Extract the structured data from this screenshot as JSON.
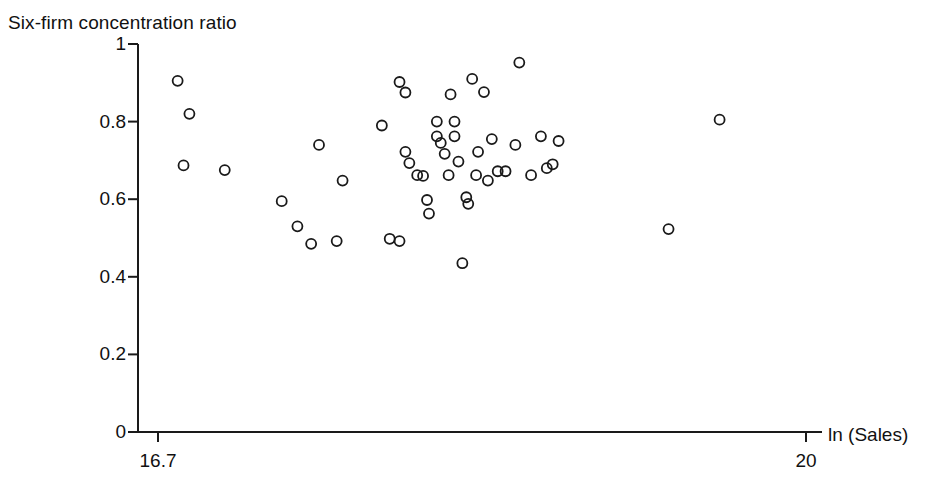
{
  "chart_data": {
    "type": "scatter",
    "title": "",
    "ylabel": "Six-firm concentration ratio",
    "xlabel": "ln (Sales)",
    "xlim": [
      16.7,
      20.0
    ],
    "ylim": [
      0,
      1
    ],
    "grid": false,
    "legend": null,
    "x_ticks": [
      {
        "value": 16.7,
        "label": "16.7"
      },
      {
        "value": 20,
        "label": "20"
      }
    ],
    "y_ticks": [
      {
        "value": 0,
        "label": "0"
      },
      {
        "value": 0.2,
        "label": "0.2"
      },
      {
        "value": 0.4,
        "label": "0.4"
      },
      {
        "value": 0.6,
        "label": "0.6"
      },
      {
        "value": 0.8,
        "label": "0.8"
      },
      {
        "value": 1,
        "label": "1"
      }
    ],
    "marker": {
      "shape": "open-circle",
      "radius": 5,
      "stroke": "#1a1a1a",
      "stroke_width": 1.8,
      "fill": "none"
    },
    "axis_color": "#1a1a1a",
    "points": [
      {
        "x": 16.8,
        "y": 0.905
      },
      {
        "x": 16.86,
        "y": 0.82
      },
      {
        "x": 16.83,
        "y": 0.687
      },
      {
        "x": 17.04,
        "y": 0.675
      },
      {
        "x": 17.33,
        "y": 0.595
      },
      {
        "x": 17.41,
        "y": 0.53
      },
      {
        "x": 17.48,
        "y": 0.485
      },
      {
        "x": 17.52,
        "y": 0.74
      },
      {
        "x": 17.61,
        "y": 0.492
      },
      {
        "x": 17.64,
        "y": 0.648
      },
      {
        "x": 17.84,
        "y": 0.79
      },
      {
        "x": 17.88,
        "y": 0.498
      },
      {
        "x": 17.93,
        "y": 0.492
      },
      {
        "x": 17.93,
        "y": 0.902
      },
      {
        "x": 17.96,
        "y": 0.875
      },
      {
        "x": 17.96,
        "y": 0.722
      },
      {
        "x": 17.98,
        "y": 0.693
      },
      {
        "x": 18.02,
        "y": 0.662
      },
      {
        "x": 18.05,
        "y": 0.66
      },
      {
        "x": 18.07,
        "y": 0.598
      },
      {
        "x": 18.08,
        "y": 0.563
      },
      {
        "x": 18.12,
        "y": 0.8
      },
      {
        "x": 18.12,
        "y": 0.762
      },
      {
        "x": 18.14,
        "y": 0.745
      },
      {
        "x": 18.16,
        "y": 0.717
      },
      {
        "x": 18.18,
        "y": 0.662
      },
      {
        "x": 18.19,
        "y": 0.87
      },
      {
        "x": 18.21,
        "y": 0.8
      },
      {
        "x": 18.21,
        "y": 0.762
      },
      {
        "x": 18.23,
        "y": 0.697
      },
      {
        "x": 18.25,
        "y": 0.435
      },
      {
        "x": 18.27,
        "y": 0.605
      },
      {
        "x": 18.28,
        "y": 0.588
      },
      {
        "x": 18.3,
        "y": 0.91
      },
      {
        "x": 18.32,
        "y": 0.662
      },
      {
        "x": 18.33,
        "y": 0.722
      },
      {
        "x": 18.36,
        "y": 0.876
      },
      {
        "x": 18.38,
        "y": 0.648
      },
      {
        "x": 18.4,
        "y": 0.755
      },
      {
        "x": 18.43,
        "y": 0.672
      },
      {
        "x": 18.47,
        "y": 0.672
      },
      {
        "x": 18.52,
        "y": 0.74
      },
      {
        "x": 18.54,
        "y": 0.952
      },
      {
        "x": 18.6,
        "y": 0.662
      },
      {
        "x": 18.65,
        "y": 0.762
      },
      {
        "x": 18.68,
        "y": 0.68
      },
      {
        "x": 18.71,
        "y": 0.69
      },
      {
        "x": 18.74,
        "y": 0.75
      },
      {
        "x": 19.3,
        "y": 0.523
      },
      {
        "x": 19.56,
        "y": 0.805
      }
    ]
  },
  "axes": {
    "x_axis_label": "ln (Sales)",
    "y_axis_label": "Six-firm concentration ratio"
  }
}
